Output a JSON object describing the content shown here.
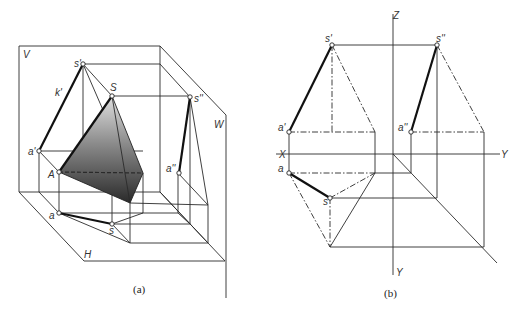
{
  "figure_a": {
    "caption": "(a)",
    "planes": {
      "V": "V",
      "W": "W",
      "H": "H"
    },
    "points": {
      "s_prime": "s'",
      "S": "S",
      "s_double_prime": "s''",
      "a_prime": "a'",
      "A": "A",
      "a_double_prime": "a''",
      "a": "a",
      "s": "s",
      "k_prime": "k'"
    },
    "shading": {
      "top": "#d8d8d8",
      "bottom": "#2e2e2e"
    }
  },
  "figure_b": {
    "caption": "(b)",
    "axes": {
      "Z": "Z",
      "X": "X",
      "Y_right": "Y",
      "Y_down": "Y"
    },
    "points": {
      "s_prime": "s'",
      "s_double_prime": "s''",
      "a_prime": "a'",
      "a_double_prime": "a''",
      "a": "a",
      "s": "s"
    }
  }
}
